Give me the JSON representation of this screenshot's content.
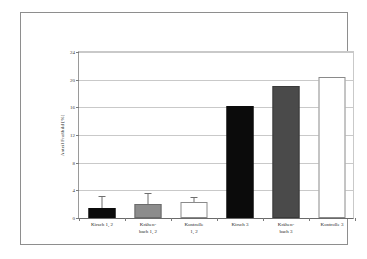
{
  "chart_data": {
    "type": "bar",
    "title": "",
    "xlabel": "",
    "ylabel": "Anteil Fraßbild [%]",
    "ylim": [
      0,
      24
    ],
    "ytick_values": [
      0,
      4,
      8,
      12,
      16,
      20,
      24
    ],
    "ytick_labels": [
      "0",
      "4",
      "8",
      "12",
      "16",
      "20",
      "24"
    ],
    "grid": true,
    "legend": "none",
    "categories": [
      "Kirsch 1, 2",
      "Krähen-\nbach 1, 2",
      "Kontrolle\n1, 2",
      "Kirsch 3",
      "Krähen-\nbach 3",
      "Kontrolle 3"
    ],
    "values": [
      1.5,
      2.0,
      2.3,
      16.0,
      18.9,
      20.1
    ],
    "errors_upper": [
      3.0,
      3.4,
      2.8,
      null,
      null,
      null
    ],
    "bar_styles": [
      "black",
      "gray",
      "white",
      "black",
      "darkgray",
      "white"
    ]
  },
  "colors": {
    "black": "#0b0b0b",
    "gray": "#8c8c8c",
    "darkgray": "#4a4a4a",
    "white": "#ffffff",
    "grid": "#c9c9c9",
    "axis": "#6a6a6a",
    "frame": "#8e8e8e",
    "text": "#2a2a2a"
  }
}
